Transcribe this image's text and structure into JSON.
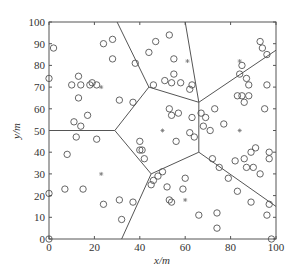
{
  "chart_data": {
    "type": "scatter",
    "title": "",
    "xlabel": "x/m",
    "ylabel": "y/m",
    "xlim": [
      0,
      100
    ],
    "ylim": [
      0,
      100
    ],
    "xticks": [
      0,
      20,
      40,
      60,
      80,
      100
    ],
    "yticks": [
      0,
      10,
      20,
      30,
      40,
      50,
      60,
      70,
      80,
      90,
      100
    ],
    "grid": false,
    "legend": null,
    "series": [
      {
        "name": "sensor nodes",
        "marker": "circle-open",
        "points": [
          [
            0,
            74
          ],
          [
            2,
            88
          ],
          [
            0,
            21
          ],
          [
            0,
            0
          ],
          [
            8,
            39
          ],
          [
            7,
            23
          ],
          [
            12,
            47
          ],
          [
            11,
            54
          ],
          [
            14,
            52
          ],
          [
            15,
            23
          ],
          [
            14,
            71
          ],
          [
            13,
            75
          ],
          [
            13,
            65
          ],
          [
            10,
            71
          ],
          [
            17,
            57
          ],
          [
            18,
            71
          ],
          [
            19,
            72
          ],
          [
            21,
            71
          ],
          [
            21,
            46
          ],
          [
            24,
            16
          ],
          [
            24,
            90
          ],
          [
            28,
            92
          ],
          [
            28,
            83
          ],
          [
            31,
            18
          ],
          [
            31,
            64
          ],
          [
            32,
            9
          ],
          [
            37,
            63
          ],
          [
            37,
            17
          ],
          [
            38,
            81
          ],
          [
            40,
            45
          ],
          [
            40,
            41
          ],
          [
            41,
            41
          ],
          [
            42,
            37
          ],
          [
            44,
            86
          ],
          [
            47,
            91
          ],
          [
            46,
            71
          ],
          [
            45,
            25
          ],
          [
            46,
            27
          ],
          [
            48,
            29
          ],
          [
            50,
            31
          ],
          [
            51,
            73
          ],
          [
            54,
            72
          ],
          [
            58,
            72
          ],
          [
            53,
            94
          ],
          [
            55,
            83
          ],
          [
            55,
            76
          ],
          [
            53,
            60
          ],
          [
            54,
            57
          ],
          [
            57,
            58
          ],
          [
            56,
            45
          ],
          [
            52,
            24
          ],
          [
            53,
            18
          ],
          [
            54,
            17
          ],
          [
            59,
            23
          ],
          [
            60,
            28
          ],
          [
            62,
            49
          ],
          [
            62,
            69
          ],
          [
            63,
            56
          ],
          [
            63,
            71
          ],
          [
            64,
            47
          ],
          [
            66,
            11
          ],
          [
            67,
            58
          ],
          [
            68,
            52
          ],
          [
            69,
            56
          ],
          [
            71,
            50
          ],
          [
            72,
            37
          ],
          [
            73,
            60
          ],
          [
            74,
            12
          ],
          [
            74,
            5
          ],
          [
            75,
            33
          ],
          [
            77,
            53
          ],
          [
            79,
            28
          ],
          [
            82,
            36
          ],
          [
            83,
            22
          ],
          [
            83,
            66
          ],
          [
            84,
            76
          ],
          [
            85,
            80
          ],
          [
            86,
            37
          ],
          [
            85,
            66
          ],
          [
            86,
            63
          ],
          [
            87,
            74
          ],
          [
            88,
            71
          ],
          [
            88,
            66
          ],
          [
            89,
            17
          ],
          [
            87,
            33
          ],
          [
            89,
            40
          ],
          [
            90,
            33
          ],
          [
            91,
            42
          ],
          [
            93,
            91
          ],
          [
            94,
            88
          ],
          [
            95,
            60
          ],
          [
            96,
            85
          ],
          [
            96,
            71
          ],
          [
            97,
            40
          ],
          [
            97,
            37
          ],
          [
            96,
            11
          ],
          [
            97,
            16
          ],
          [
            98,
            0
          ],
          [
            93,
            30
          ]
        ]
      },
      {
        "name": "cluster heads",
        "marker": "star",
        "points": [
          [
            23,
            70
          ],
          [
            23,
            30
          ],
          [
            50,
            50
          ],
          [
            61,
            82
          ],
          [
            84,
            82
          ],
          [
            84,
            50
          ],
          [
            60,
            18
          ]
        ]
      }
    ],
    "voronoi_edges": [
      [
        [
          0,
          50
        ],
        [
          29,
          50
        ]
      ],
      [
        [
          29,
          50
        ],
        [
          44,
          70
        ]
      ],
      [
        [
          44,
          70
        ],
        [
          30,
          100
        ]
      ],
      [
        [
          44,
          70
        ],
        [
          66,
          63
        ]
      ],
      [
        [
          66,
          63
        ],
        [
          60,
          100
        ]
      ],
      [
        [
          66,
          63
        ],
        [
          100,
          87
        ]
      ],
      [
        [
          66,
          63
        ],
        [
          66,
          40
        ]
      ],
      [
        [
          66,
          40
        ],
        [
          100,
          15
        ]
      ],
      [
        [
          66,
          40
        ],
        [
          45,
          30
        ]
      ],
      [
        [
          29,
          50
        ],
        [
          45,
          30
        ]
      ],
      [
        [
          45,
          30
        ],
        [
          32,
          0
        ]
      ]
    ]
  }
}
